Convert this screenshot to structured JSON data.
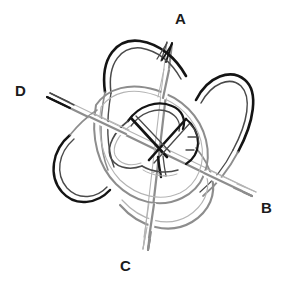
{
  "figure": {
    "kind": "knot-diagram",
    "style": "hand-drawn pencil sketch",
    "background_color": "#ffffff",
    "ink_color": "#141414",
    "shade_color": "#8d8d8d",
    "width": 284,
    "height": 283
  },
  "labels": [
    {
      "id": "A",
      "text": "A",
      "x": 180,
      "y": 18
    },
    {
      "id": "B",
      "text": "B",
      "x": 266,
      "y": 207
    },
    {
      "id": "C",
      "text": "C",
      "x": 125,
      "y": 265
    },
    {
      "id": "D",
      "text": "D",
      "x": 20,
      "y": 90
    }
  ],
  "strand_ends": {
    "a_label": "A",
    "b_label": "B",
    "c_label": "C",
    "d_label": "D"
  }
}
